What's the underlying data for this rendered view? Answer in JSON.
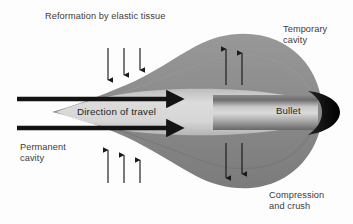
{
  "figure": {
    "background_color": "#fdfdfd",
    "labels": {
      "reformation": "Reformation by elastic tissue",
      "temporary_cavity_line1": "Temporary",
      "temporary_cavity_line2": "cavity",
      "permanent_cavity_line1": "Permanent",
      "permanent_cavity_line2": "cavity",
      "compression_line1": "Compression",
      "compression_line2": "and crush",
      "direction_of_travel": "Direction of travel",
      "bullet": "Bullet"
    },
    "colors": {
      "temporary_cavity_fill": "#8d8d8d",
      "temporary_cavity_fill_dark": "#7c7c7c",
      "permanent_cavity_fill": "#cfcfcf",
      "bullet_body_light": "#d2d2d2",
      "bullet_body_dark": "#6f6f6f",
      "bullet_nose": "#111111",
      "arrow_color": "#1a1a1a",
      "text_color": "#3b3b3b"
    },
    "arrow_groups": [
      {
        "name": "top-left-inward",
        "direction": "down",
        "count": 3,
        "meaning": "elastic tissue reformation"
      },
      {
        "name": "top-right-outward",
        "direction": "up",
        "count": 2,
        "meaning": "temporary cavity expansion"
      },
      {
        "name": "bottom-left-inward",
        "direction": "up",
        "count": 3,
        "meaning": "elastic tissue reformation"
      },
      {
        "name": "bottom-right-outward",
        "direction": "down",
        "count": 2,
        "meaning": "temporary cavity expansion"
      },
      {
        "name": "travel-upper",
        "direction": "right",
        "count": 1,
        "meaning": "direction of travel"
      },
      {
        "name": "travel-lower",
        "direction": "right",
        "count": 1,
        "meaning": "direction of travel"
      }
    ]
  }
}
